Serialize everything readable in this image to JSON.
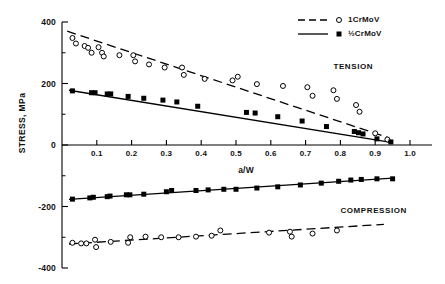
{
  "chart_data": {
    "type": "scatter",
    "title": "",
    "xlabel": "a/W",
    "ylabel": "STRESS, MPa",
    "xlim": [
      0,
      1.0
    ],
    "ylim": [
      -400,
      400
    ],
    "grid": false,
    "x_ticks": [
      "0.1",
      "0.2",
      "0.3",
      "0.4",
      "0.5",
      "0.6",
      "0.7",
      "0.8",
      "0.9",
      "1.0"
    ],
    "x_tick_values": [
      0.1,
      0.2,
      0.3,
      0.4,
      0.5,
      0.6,
      0.7,
      0.8,
      0.9,
      1.0
    ],
    "y_ticks": [
      "400",
      "200",
      "0",
      "-200",
      "-400"
    ],
    "y_tick_values": [
      400,
      200,
      0,
      -200,
      -400
    ],
    "y_minor_values": [
      300,
      100,
      -100,
      -300
    ],
    "legend_position": "top-right",
    "annotations": [
      {
        "text": "TENSION",
        "x": 0.78,
        "y": 255
      },
      {
        "text": "COMPRESSION",
        "x": 0.8,
        "y": -215
      }
    ],
    "series": [
      {
        "name": "1CrMoV",
        "marker": "open-circle",
        "line": "dashed",
        "region": "tension",
        "points": [
          [
            0.03,
            348
          ],
          [
            0.04,
            330
          ],
          [
            0.065,
            322
          ],
          [
            0.075,
            316
          ],
          [
            0.085,
            300
          ],
          [
            0.105,
            318
          ],
          [
            0.115,
            300
          ],
          [
            0.12,
            288
          ],
          [
            0.165,
            292
          ],
          [
            0.205,
            292
          ],
          [
            0.21,
            272
          ],
          [
            0.25,
            262
          ],
          [
            0.295,
            252
          ],
          [
            0.345,
            252
          ],
          [
            0.35,
            228
          ],
          [
            0.41,
            215
          ],
          [
            0.49,
            210
          ],
          [
            0.505,
            222
          ],
          [
            0.56,
            198
          ],
          [
            0.635,
            192
          ],
          [
            0.705,
            188
          ],
          [
            0.72,
            160
          ],
          [
            0.78,
            178
          ],
          [
            0.79,
            150
          ],
          [
            0.845,
            130
          ],
          [
            0.855,
            108
          ],
          [
            0.9,
            38
          ],
          [
            0.935,
            18
          ]
        ]
      },
      {
        "name": "1CrMoV",
        "marker": "open-circle",
        "line": "dashed",
        "region": "compression",
        "points": [
          [
            0.03,
            -318
          ],
          [
            0.055,
            -320
          ],
          [
            0.07,
            -320
          ],
          [
            0.095,
            -308
          ],
          [
            0.098,
            -332
          ],
          [
            0.14,
            -315
          ],
          [
            0.19,
            -318
          ],
          [
            0.196,
            -300
          ],
          [
            0.24,
            -298
          ],
          [
            0.285,
            -300
          ],
          [
            0.335,
            -300
          ],
          [
            0.385,
            -298
          ],
          [
            0.43,
            -295
          ],
          [
            0.455,
            -278
          ],
          [
            0.595,
            -285
          ],
          [
            0.655,
            -282
          ],
          [
            0.66,
            -298
          ],
          [
            0.72,
            -288
          ],
          [
            0.79,
            -278
          ]
        ]
      },
      {
        "name": "½CrMoV",
        "marker": "filled-square",
        "line": "solid",
        "region": "tension",
        "points": [
          [
            0.03,
            176
          ],
          [
            0.085,
            170
          ],
          [
            0.095,
            170
          ],
          [
            0.13,
            166
          ],
          [
            0.14,
            166
          ],
          [
            0.19,
            158
          ],
          [
            0.235,
            152
          ],
          [
            0.29,
            146
          ],
          [
            0.33,
            140
          ],
          [
            0.39,
            126
          ],
          [
            0.53,
            106
          ],
          [
            0.555,
            104
          ],
          [
            0.62,
            92
          ],
          [
            0.69,
            78
          ],
          [
            0.76,
            60
          ],
          [
            0.84,
            44
          ],
          [
            0.852,
            40
          ],
          [
            0.865,
            36
          ],
          [
            0.905,
            20
          ],
          [
            0.945,
            10
          ]
        ]
      },
      {
        "name": "½CrMoV",
        "marker": "filled-square",
        "line": "solid",
        "region": "compression",
        "points": [
          [
            0.03,
            -176
          ],
          [
            0.08,
            -172
          ],
          [
            0.09,
            -170
          ],
          [
            0.13,
            -168
          ],
          [
            0.138,
            -166
          ],
          [
            0.185,
            -162
          ],
          [
            0.195,
            -162
          ],
          [
            0.235,
            -160
          ],
          [
            0.3,
            -152
          ],
          [
            0.315,
            -148
          ],
          [
            0.385,
            -148
          ],
          [
            0.42,
            -146
          ],
          [
            0.465,
            -144
          ],
          [
            0.5,
            -144
          ],
          [
            0.56,
            -140
          ],
          [
            0.62,
            -136
          ],
          [
            0.685,
            -130
          ],
          [
            0.745,
            -124
          ],
          [
            0.795,
            -118
          ],
          [
            0.83,
            -114
          ],
          [
            0.86,
            -112
          ],
          [
            0.905,
            -110
          ],
          [
            0.95,
            -110
          ]
        ]
      }
    ],
    "trend_lines": [
      {
        "name": "1CrMoV-tension",
        "style": "dashed",
        "x1": 0.015,
        "y1": 370,
        "x2": 0.935,
        "y2": 25
      },
      {
        "name": "1CrMoV-compression",
        "style": "dashed",
        "x1": 0.02,
        "y1": -322,
        "x2": 0.925,
        "y2": -258
      },
      {
        "name": "halfCrMoV-tension",
        "style": "solid",
        "x1": 0.02,
        "y1": 178,
        "x2": 0.95,
        "y2": 8
      },
      {
        "name": "halfCrMoV-compression",
        "style": "solid",
        "x1": 0.02,
        "y1": -177,
        "x2": 0.95,
        "y2": -108
      }
    ]
  },
  "legend": {
    "items": [
      {
        "label": "1CrMoV",
        "marker": "open-circle",
        "line": "dashed"
      },
      {
        "label": "½CrMoV",
        "marker": "filled-square",
        "line": "solid"
      }
    ]
  },
  "axes": {
    "y_title": "STRESS, MPa",
    "x_title": "a/W"
  }
}
